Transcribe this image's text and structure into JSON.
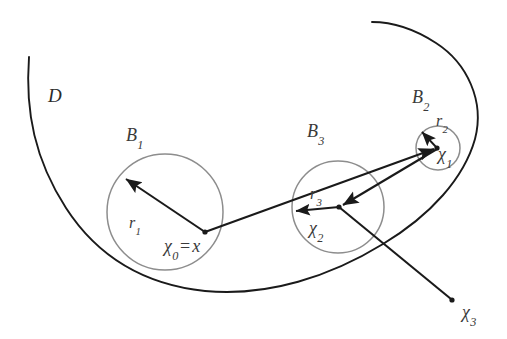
{
  "figure": {
    "type": "geometric-diagram",
    "width": 507,
    "height": 339,
    "background_color": "#ffffff",
    "boundary_color": "#1a1a1a",
    "circle_color": "#8a8a8a",
    "arrow_color": "#1a1a1a",
    "label_color": "#3a3a3a"
  },
  "labels": {
    "domain": {
      "text": "D",
      "x": 48,
      "y": 86
    },
    "ball_1": {
      "base": "B",
      "sub": "1",
      "x": 126,
      "y": 126
    },
    "ball_2": {
      "base": "B",
      "sub": "2",
      "x": 412,
      "y": 88
    },
    "ball_3": {
      "base": "B",
      "sub": "3",
      "x": 307,
      "y": 122
    },
    "radius_1": {
      "base": "r",
      "sub": "1",
      "x": 129,
      "y": 215
    },
    "radius_2": {
      "base": "r",
      "sub": "2",
      "x": 436,
      "y": 113
    },
    "radius_3": {
      "base": "r",
      "sub": "3",
      "x": 310,
      "y": 186
    },
    "center_0": {
      "base": "χ",
      "sub": "0",
      "equals": "=",
      "value": "x",
      "x": 164,
      "y": 237
    },
    "center_1": {
      "base": "χ",
      "sub": "1",
      "x": 438,
      "y": 145
    },
    "center_2": {
      "base": "χ",
      "sub": "2",
      "x": 309,
      "y": 219
    },
    "center_3": {
      "base": "χ",
      "sub": "3",
      "x": 462,
      "y": 303
    }
  },
  "geometry": {
    "circles": [
      {
        "name": "B1",
        "cx": 165,
        "cy": 212,
        "r": 58
      },
      {
        "name": "B3",
        "cx": 338,
        "cy": 207,
        "r": 46
      },
      {
        "name": "B2",
        "cx": 438,
        "cy": 148,
        "r": 22
      }
    ],
    "centers": [
      {
        "name": "chi0",
        "x": 205,
        "y": 232
      },
      {
        "name": "chi1",
        "x": 437,
        "y": 148
      },
      {
        "name": "chi2",
        "x": 339,
        "y": 207
      },
      {
        "name": "chi3",
        "x": 452,
        "y": 300
      }
    ],
    "radius_arrows": [
      {
        "name": "r1",
        "from": [
          205,
          232
        ],
        "to": [
          124,
          177
        ]
      },
      {
        "name": "r2",
        "from": [
          437,
          148
        ],
        "to": [
          421,
          131
        ]
      },
      {
        "name": "r3",
        "from": [
          339,
          207
        ],
        "to": [
          294,
          211
        ]
      }
    ],
    "chain_arrows": [
      {
        "name": "chi0-to-chi1",
        "from": [
          205,
          232
        ],
        "to": [
          437,
          148
        ]
      },
      {
        "name": "chi1-to-chi2",
        "from": [
          437,
          148
        ],
        "to": [
          339,
          207
        ]
      },
      {
        "name": "chi2-to-chi3",
        "from": [
          339,
          207
        ],
        "to": [
          452,
          300
        ]
      }
    ],
    "boundary_path": "M 29 57 C 26 108 34 158 64 206 C 96 258 146 284 204 290 C 268 296 330 276 382 245 C 430 217 463 180 474 141 C 484 104 468 66 437 45 C 414 29 390 22 372 22"
  }
}
